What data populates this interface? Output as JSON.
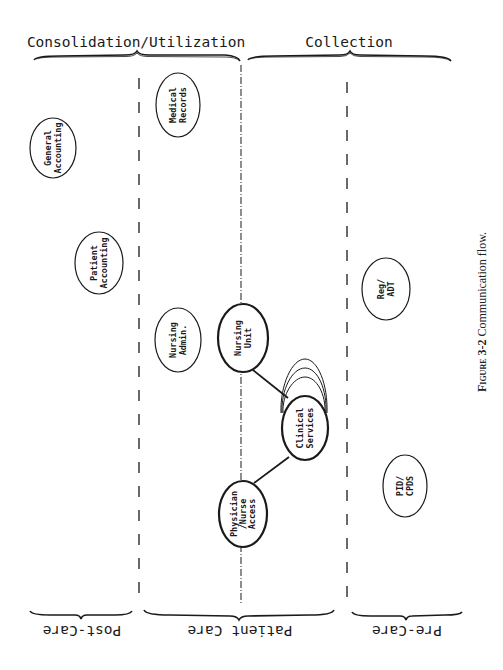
{
  "top_headers": [
    {
      "label": "Consolidation/Utilization"
    },
    {
      "label": "Collection"
    }
  ],
  "bottom_headers": [
    {
      "label": "Post-Care"
    },
    {
      "label": "Patient Care"
    },
    {
      "label": "Pre-Care"
    }
  ],
  "nodes": {
    "general_accounting": {
      "line1": "General",
      "line2": "Accounting"
    },
    "medical_records": {
      "line1": "Medical",
      "line2": "Records"
    },
    "patient_accounting": {
      "line1": "Patient",
      "line2": "Accounting"
    },
    "nursing_admin": {
      "line1": "Nursing",
      "line2": "Admin."
    },
    "nursing_unit": {
      "line1": "Nursing",
      "line2": "Unit"
    },
    "clinical_services": {
      "line1": "Clinical",
      "line2": "Services"
    },
    "physician_nurse_access": {
      "line1": "Physician",
      "line2": "/Nurse",
      "line3": "Access"
    },
    "reg_adt": {
      "line1": "Reg/",
      "line2": "ADT"
    },
    "pid_cpds": {
      "line1": "PID/",
      "line2": "CPDS"
    }
  },
  "caption": {
    "figure_label": "Figure 3-2",
    "text": " Communication flow."
  },
  "colors": {
    "ink": "#1a1a1a",
    "background": "#ffffff"
  }
}
